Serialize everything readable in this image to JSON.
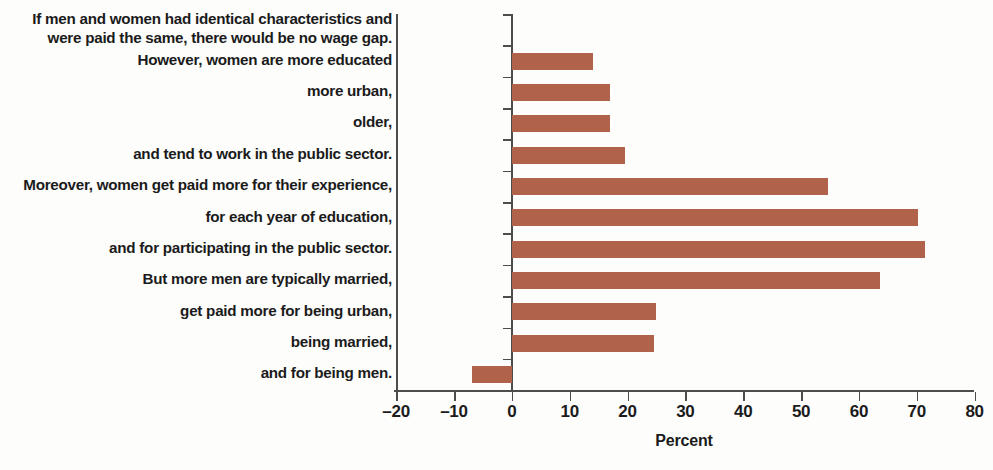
{
  "chart_data": {
    "type": "bar",
    "orientation": "horizontal",
    "title": "",
    "subtitle": "",
    "xlabel": "Percent",
    "ylabel": "",
    "xlim": [
      -20,
      80
    ],
    "xticks": [
      -20,
      -10,
      0,
      10,
      20,
      30,
      40,
      50,
      60,
      70,
      80
    ],
    "xtick_labels": [
      "–20",
      "–10",
      "0",
      "10",
      "20",
      "30",
      "40",
      "50",
      "60",
      "70",
      "80"
    ],
    "grid": false,
    "legend": null,
    "bar_color": "#b0624a",
    "axis_color": "#4d4d4d",
    "categories": [
      "If men and women had identical characteristics and\nwere paid the same, there would be no wage gap.",
      "However, women are more educated",
      "more urban,",
      "older,",
      "and tend to work in the public sector.",
      "Moreover, women get paid more for their experience,",
      "for each year of education,",
      "and for participating in the public sector.",
      "But more men are typically married,",
      "get paid more for being urban,",
      "being married,",
      "and for being men."
    ],
    "values": [
      0,
      14.0,
      17.0,
      17.0,
      19.5,
      54.7,
      70.2,
      71.5,
      63.7,
      25.0,
      24.5,
      -6.8
    ]
  }
}
